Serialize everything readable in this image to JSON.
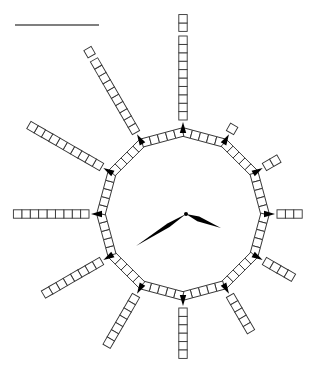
{
  "diagram": {
    "type": "clock-counting-diagram",
    "background": "#ffffff",
    "stroke_color": "#333333",
    "marker_color": "#000000",
    "answer_line": {
      "x1": 15,
      "y1": 25,
      "x2": 99,
      "y2": 25,
      "color": "#555555"
    },
    "center": {
      "x": 183,
      "y": 214
    },
    "ring": {
      "radius": 82,
      "sides": 12,
      "squares_per_side": 5
    },
    "square_size": 8.4,
    "spoke_offset": 12,
    "spokes": [
      {
        "hour": 1,
        "groups": [
          1
        ]
      },
      {
        "hour": 2,
        "groups": [
          2
        ]
      },
      {
        "hour": 3,
        "groups": [
          3
        ]
      },
      {
        "hour": 4,
        "groups": [
          4
        ]
      },
      {
        "hour": 5,
        "groups": [
          5
        ]
      },
      {
        "hour": 6,
        "groups": [
          6
        ]
      },
      {
        "hour": 7,
        "groups": [
          7
        ]
      },
      {
        "hour": 8,
        "groups": [
          8
        ]
      },
      {
        "hour": 9,
        "groups": [
          9
        ]
      },
      {
        "hour": 10,
        "groups": [
          10
        ]
      },
      {
        "hour": 11,
        "groups": [
          10,
          1
        ]
      },
      {
        "hour": 12,
        "groups": [
          10,
          2
        ]
      }
    ],
    "hands": {
      "hour_hand": {
        "tip": {
          "x": 221,
          "y": 228
        },
        "width": 5,
        "points_to": "about 4"
      },
      "minute_hand": {
        "tip": {
          "x": 136,
          "y": 246
        },
        "width": 4,
        "points_to": "about 40 minutes"
      }
    }
  }
}
